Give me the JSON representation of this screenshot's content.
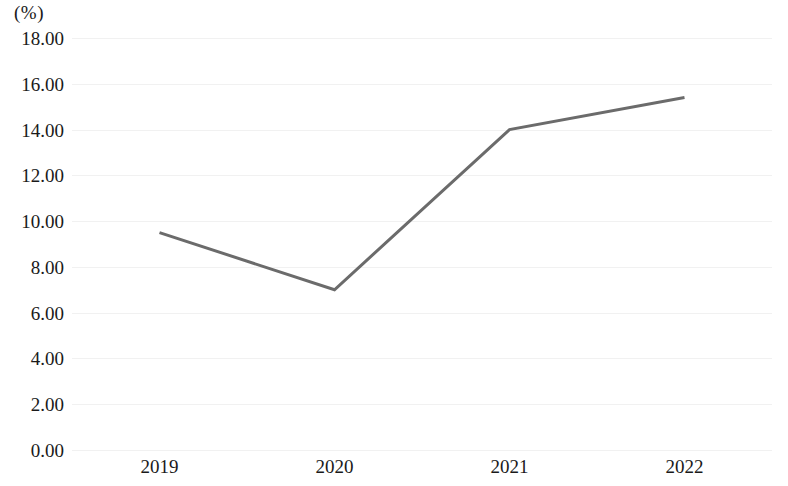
{
  "chart_data": {
    "type": "line",
    "title": "",
    "subtitle": "",
    "xlabel": "",
    "ylabel": "(%)",
    "unit_label": "(%)",
    "categories": [
      "2019",
      "2020",
      "2021",
      "2022"
    ],
    "series": [
      {
        "name": "",
        "values": [
          9.5,
          7.0,
          14.0,
          15.4
        ]
      }
    ],
    "ylim": [
      0,
      18
    ],
    "ytick_step": 2,
    "ytick_labels": [
      "18.00",
      "16.00",
      "14.00",
      "12.00",
      "10.00",
      "8.00",
      "6.00",
      "4.00",
      "2.00",
      "0.00"
    ],
    "ytick_values": [
      18,
      16,
      14,
      12,
      10,
      8,
      6,
      4,
      2,
      0
    ],
    "grid": true,
    "grid_axis": "y",
    "legend": false,
    "legend_position": "none",
    "markers": false,
    "colors": {
      "line": "#6b6b6b",
      "grid": "#f1f1f1",
      "background": "#ffffff",
      "text": "#1a1a1a"
    },
    "line_width": 3
  }
}
